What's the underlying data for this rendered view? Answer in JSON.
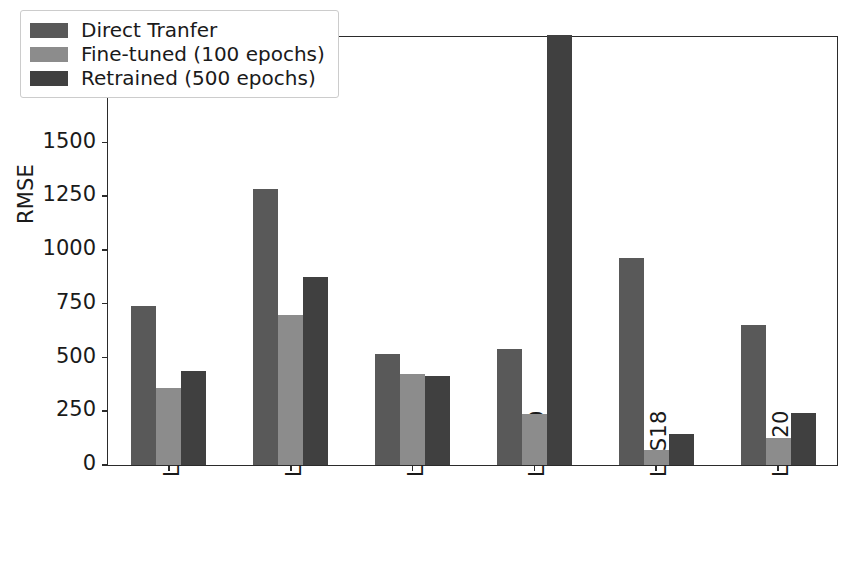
{
  "chart_data": {
    "type": "bar",
    "title": "",
    "xlabel": "",
    "ylabel": "RMSE",
    "ylim": [
      0,
      2000
    ],
    "yticks": [
      0,
      250,
      500,
      750,
      1000,
      1250,
      1500,
      1750,
      2000
    ],
    "ytick_labels": [
      "0",
      "250",
      "500",
      "750",
      "1000",
      "1250",
      "1500",
      "1750",
      "2000"
    ],
    "grid": false,
    "legend_position": "upper left",
    "categories": [
      "L1S19",
      "L2S17",
      "L2S18",
      "L2S20",
      "L3S18",
      "L3S20"
    ],
    "series": [
      {
        "name": "Direct Tranfer",
        "color": "#595959",
        "values": [
          738,
          1285,
          515,
          540,
          965,
          650
        ]
      },
      {
        "name": "Fine-tuned (100 epochs)",
        "color": "#8c8c8c",
        "values": [
          360,
          700,
          425,
          237,
          68,
          125
        ]
      },
      {
        "name": "Retrained (500 epochs)",
        "color": "#404040",
        "values": [
          435,
          875,
          412,
          2000,
          145,
          240
        ]
      }
    ]
  },
  "colors": {
    "axis": "#2b2b2b",
    "background": "#ffffff",
    "legend_border": "#cccccc"
  }
}
